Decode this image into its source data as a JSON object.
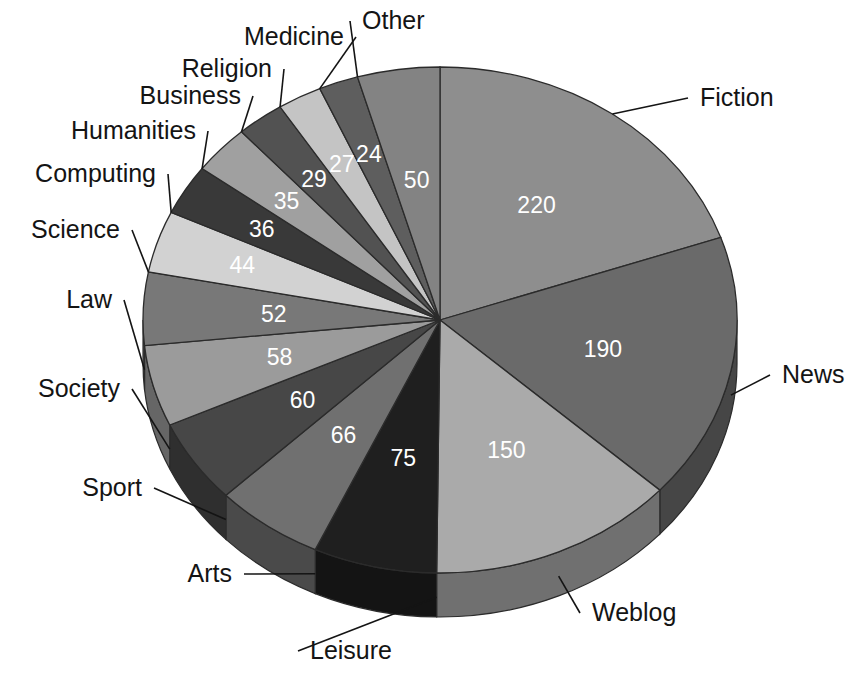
{
  "chart_data": {
    "type": "pie",
    "title": "",
    "subtitle": "",
    "xlabel": "",
    "ylabel": "",
    "legend_position": "callout-labels",
    "grid": false,
    "three_d": true,
    "start_angle_deg": 0,
    "direction": "clockwise",
    "total": 1116,
    "categories": [
      "Fiction",
      "News",
      "Weblog",
      "Leisure",
      "Arts",
      "Sport",
      "Society",
      "Law",
      "Science",
      "Computing",
      "Humanities",
      "Business",
      "Religion",
      "Medicine",
      "Other"
    ],
    "values": [
      220,
      190,
      150,
      75,
      66,
      60,
      58,
      52,
      44,
      36,
      35,
      29,
      27,
      24,
      50
    ],
    "slices": [
      {
        "label": "Fiction",
        "value": 220,
        "value_text": "220",
        "color": "#8e8e8e",
        "label_side": "right"
      },
      {
        "label": "News",
        "value": 190,
        "value_text": "190",
        "color": "#6a6a6a",
        "label_side": "right"
      },
      {
        "label": "Weblog",
        "value": 150,
        "value_text": "150",
        "color": "#aaaaaa",
        "label_side": "bottom"
      },
      {
        "label": "Leisure",
        "value": 75,
        "value_text": "75",
        "color": "#1f1f1f",
        "label_side": "bottom"
      },
      {
        "label": "Arts",
        "value": 66,
        "value_text": "66",
        "color": "#707070",
        "label_side": "left"
      },
      {
        "label": "Sport",
        "value": 60,
        "value_text": "60",
        "color": "#474747",
        "label_side": "left"
      },
      {
        "label": "Society",
        "value": 58,
        "value_text": "58",
        "color": "#9b9b9b",
        "label_side": "left"
      },
      {
        "label": "Law",
        "value": 52,
        "value_text": "52",
        "color": "#787878",
        "label_side": "left"
      },
      {
        "label": "Science",
        "value": 44,
        "value_text": "44",
        "color": "#d2d2d2",
        "label_side": "left"
      },
      {
        "label": "Computing",
        "value": 36,
        "value_text": "36",
        "color": "#393939",
        "label_side": "left"
      },
      {
        "label": "Humanities",
        "value": 35,
        "value_text": "35",
        "color": "#a0a0a0",
        "label_side": "left"
      },
      {
        "label": "Business",
        "value": 29,
        "value_text": "29",
        "color": "#525252",
        "label_side": "top"
      },
      {
        "label": "Religion",
        "value": 27,
        "value_text": "27",
        "color": "#c4c4c4",
        "label_side": "top"
      },
      {
        "label": "Medicine",
        "value": 24,
        "value_text": "24",
        "color": "#5e5e5e",
        "label_side": "top"
      },
      {
        "label": "Other",
        "value": 50,
        "value_text": "50",
        "color": "#838383",
        "label_side": "top"
      }
    ],
    "callout_labels": [
      {
        "name": "Fiction",
        "text": "Fiction",
        "x": 700,
        "y": 106,
        "align": "start"
      },
      {
        "name": "News",
        "text": "News",
        "x": 782,
        "y": 383,
        "align": "start"
      },
      {
        "name": "Weblog",
        "text": "Weblog",
        "x": 592,
        "y": 621,
        "align": "start"
      },
      {
        "name": "Leisure",
        "text": "Leisure",
        "x": 310,
        "y": 659,
        "align": "start"
      },
      {
        "name": "Arts",
        "text": "Arts",
        "x": 232,
        "y": 582,
        "align": "end"
      },
      {
        "name": "Sport",
        "text": "Sport",
        "x": 142,
        "y": 496,
        "align": "end"
      },
      {
        "name": "Society",
        "text": "Society",
        "x": 120,
        "y": 397,
        "align": "end"
      },
      {
        "name": "Law",
        "text": "Law",
        "x": 112,
        "y": 308,
        "align": "end"
      },
      {
        "name": "Science",
        "text": "Science",
        "x": 120,
        "y": 238,
        "align": "end"
      },
      {
        "name": "Computing",
        "text": "Computing",
        "x": 156,
        "y": 182,
        "align": "end"
      },
      {
        "name": "Humanities",
        "text": "Humanities",
        "x": 196,
        "y": 139,
        "align": "end"
      },
      {
        "name": "Business",
        "text": "Business",
        "x": 241,
        "y": 104,
        "align": "end"
      },
      {
        "name": "Religion",
        "text": "Religion",
        "x": 272,
        "y": 77,
        "align": "end"
      },
      {
        "name": "Medicine",
        "text": "Medicine",
        "x": 344,
        "y": 45,
        "align": "end"
      },
      {
        "name": "Other",
        "text": "Other",
        "x": 362,
        "y": 29,
        "align": "start"
      }
    ]
  },
  "geometry": {
    "cx": 440,
    "cy": 320,
    "rx": 297,
    "ry": 253,
    "depth": 44
  },
  "palette": {
    "background": "#ffffff",
    "outline": "#2b2b2b",
    "label_text": "#141414",
    "value_text": "#ffffff"
  }
}
